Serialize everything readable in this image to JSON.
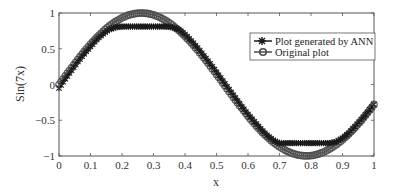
{
  "chart_data": {
    "type": "line",
    "title": "",
    "xlabel": "x",
    "ylabel": "Sin(7x)",
    "xlim": [
      0,
      1
    ],
    "ylim": [
      -1,
      1
    ],
    "grid": false,
    "legend_position": "upper right (inside)",
    "xticks": [
      0,
      0.1,
      0.2,
      0.3,
      0.4,
      0.5,
      0.6,
      0.7,
      0.8,
      0.9,
      1
    ],
    "xtick_labels": [
      "0",
      "0.1",
      "0.2",
      "0.3",
      "0.4",
      "0.5",
      "0.6",
      "0.7",
      "0.8",
      "0.9",
      "1"
    ],
    "yticks": [
      -1,
      -0.5,
      0,
      0.5,
      1
    ],
    "ytick_labels": [
      "−1",
      "−0.5",
      "0",
      "0.5",
      "1"
    ],
    "x": [
      0,
      0.02,
      0.04,
      0.06,
      0.08,
      0.1,
      0.12,
      0.14,
      0.16,
      0.18,
      0.2,
      0.22,
      0.24,
      0.26,
      0.28,
      0.3,
      0.32,
      0.34,
      0.36,
      0.38,
      0.4,
      0.42,
      0.44,
      0.46,
      0.48,
      0.5,
      0.52,
      0.54,
      0.56,
      0.58,
      0.6,
      0.62,
      0.64,
      0.66,
      0.68,
      0.7,
      0.72,
      0.74,
      0.76,
      0.78,
      0.8,
      0.82,
      0.84,
      0.86,
      0.88,
      0.9,
      0.92,
      0.94,
      0.96,
      0.98,
      1.0
    ],
    "series": [
      {
        "name": "Plot generated by ANN",
        "marker": "star-cross",
        "color": "#1a1a1a",
        "values": [
          -0.05,
          0.08,
          0.2,
          0.32,
          0.43,
          0.53,
          0.63,
          0.71,
          0.77,
          0.8,
          0.81,
          0.81,
          0.81,
          0.81,
          0.81,
          0.81,
          0.81,
          0.81,
          0.8,
          0.77,
          0.7,
          0.61,
          0.51,
          0.4,
          0.29,
          0.17,
          0.05,
          -0.07,
          -0.19,
          -0.31,
          -0.42,
          -0.52,
          -0.62,
          -0.71,
          -0.78,
          -0.82,
          -0.82,
          -0.82,
          -0.82,
          -0.82,
          -0.82,
          -0.82,
          -0.82,
          -0.82,
          -0.8,
          -0.75,
          -0.68,
          -0.59,
          -0.49,
          -0.39,
          -0.28
        ]
      },
      {
        "name": "Original plot",
        "marker": "circle",
        "color": "#4a4a4a",
        "values": [
          0,
          0.12,
          0.238,
          0.352,
          0.462,
          0.565,
          0.659,
          0.745,
          0.819,
          0.882,
          0.932,
          0.969,
          0.991,
          1.0,
          0.994,
          0.974,
          0.94,
          0.892,
          0.831,
          0.759,
          0.675,
          0.583,
          0.481,
          0.373,
          0.259,
          0.141,
          0.022,
          -0.098,
          -0.216,
          -0.33,
          -0.443,
          -0.547,
          -0.645,
          -0.73,
          -0.808,
          -0.872,
          -0.924,
          -0.963,
          -0.988,
          -0.999,
          -0.996,
          -0.978,
          -0.946,
          -0.9,
          -0.842,
          -0.773,
          -0.693,
          -0.601,
          -0.502,
          -0.393,
          -0.279
        ]
      }
    ]
  },
  "legend": {
    "items": [
      {
        "label": "Plot generated by ANN",
        "icon": "star-marker-line-icon"
      },
      {
        "label": "Original plot",
        "icon": "circle-marker-line-icon"
      }
    ]
  },
  "axes": {
    "xlabel": "x",
    "ylabel": "Sin(7x)"
  }
}
